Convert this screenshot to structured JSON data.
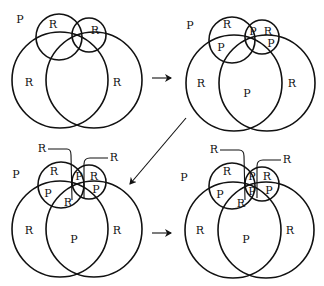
{
  "diagram": {
    "panels": [
      {
        "id": "panel-1",
        "labels": [
          {
            "text": "P",
            "x": 20,
            "y": 20
          },
          {
            "text": "R",
            "x": 53,
            "y": 25
          },
          {
            "text": "R",
            "x": 95,
            "y": 31
          },
          {
            "text": "R",
            "x": 29,
            "y": 83
          },
          {
            "text": "R",
            "x": 117,
            "y": 83
          }
        ]
      },
      {
        "id": "panel-2",
        "labels": [
          {
            "text": "P",
            "x": 190,
            "y": 26
          },
          {
            "text": "R",
            "x": 227,
            "y": 25
          },
          {
            "text": "P",
            "x": 253,
            "y": 32
          },
          {
            "text": "R",
            "x": 268,
            "y": 32
          },
          {
            "text": "P",
            "x": 221,
            "y": 48
          },
          {
            "text": "P",
            "x": 271,
            "y": 44
          },
          {
            "text": "R",
            "x": 201,
            "y": 84
          },
          {
            "text": "P",
            "x": 247,
            "y": 94
          },
          {
            "text": "R",
            "x": 292,
            "y": 84
          }
        ]
      },
      {
        "id": "panel-3",
        "labels": [
          {
            "text": "R",
            "x": 42,
            "y": 149
          },
          {
            "text": "R",
            "x": 114,
            "y": 158
          },
          {
            "text": "P",
            "x": 16,
            "y": 175
          },
          {
            "text": "R",
            "x": 54,
            "y": 172
          },
          {
            "text": "P",
            "x": 79,
            "y": 177
          },
          {
            "text": "R",
            "x": 94,
            "y": 177
          },
          {
            "text": "P",
            "x": 48,
            "y": 194
          },
          {
            "text": "P",
            "x": 96,
            "y": 190
          },
          {
            "text": "R",
            "x": 68,
            "y": 203
          },
          {
            "text": "R",
            "x": 29,
            "y": 231
          },
          {
            "text": "P",
            "x": 74,
            "y": 240
          },
          {
            "text": "R",
            "x": 117,
            "y": 231
          }
        ]
      },
      {
        "id": "panel-4",
        "labels": [
          {
            "text": "R",
            "x": 214,
            "y": 150
          },
          {
            "text": "R",
            "x": 287,
            "y": 160
          },
          {
            "text": "P",
            "x": 184,
            "y": 178
          },
          {
            "text": "R",
            "x": 227,
            "y": 172
          },
          {
            "text": "P",
            "x": 252,
            "y": 177
          },
          {
            "text": "R",
            "x": 267,
            "y": 177
          },
          {
            "text": "P",
            "x": 220,
            "y": 195
          },
          {
            "text": "P",
            "x": 252,
            "y": 192
          },
          {
            "text": "P",
            "x": 269,
            "y": 191
          },
          {
            "text": "R",
            "x": 241,
            "y": 204
          },
          {
            "text": "R",
            "x": 200,
            "y": 231
          },
          {
            "text": "P",
            "x": 246,
            "y": 240
          },
          {
            "text": "R",
            "x": 290,
            "y": 231
          }
        ]
      }
    ],
    "arrows": [
      {
        "id": "arrow-1-to-2",
        "direction": "right"
      },
      {
        "id": "arrow-2-to-3",
        "direction": "down-left"
      },
      {
        "id": "arrow-3-to-4",
        "direction": "right"
      }
    ]
  }
}
